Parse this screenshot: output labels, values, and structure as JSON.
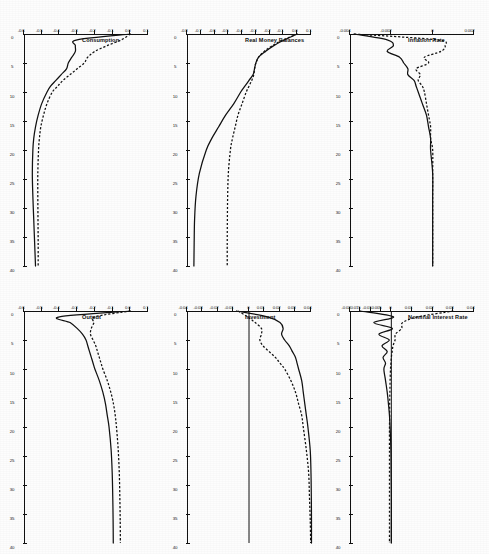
{
  "figure": {
    "orientation": "rotated-90",
    "rows": 2,
    "cols": 3,
    "line_color": "#111111",
    "background": "#ffffff"
  },
  "legend": {
    "series_solid": "Solid line",
    "series_dashed": "Dashed line"
  },
  "chart_data": [
    {
      "type": "line",
      "title": "Consumption",
      "xlabel": "",
      "ylabel": "",
      "xlim": [
        0,
        40
      ],
      "ylim": [
        -0.6,
        0.1
      ],
      "xticks": [
        0,
        5,
        10,
        15,
        20,
        25,
        30,
        35,
        40
      ],
      "xticklabels": [
        "0",
        "5",
        "10",
        "15",
        "20",
        "25",
        "30",
        "35",
        "40"
      ],
      "yticks": [
        0.1,
        0.0,
        -0.1,
        -0.2,
        -0.3,
        -0.4,
        -0.5,
        -0.6
      ],
      "yticklabels": [
        "0.1",
        "0.0",
        "-0.1",
        "-0.2",
        "-0.3",
        "-0.4",
        "-0.5",
        "-0.6"
      ],
      "grid": false,
      "x": [
        0,
        1,
        2,
        3,
        4,
        5,
        6,
        7,
        8,
        9,
        10,
        12,
        14,
        16,
        18,
        20,
        24,
        28,
        32,
        36,
        40
      ],
      "series": [
        {
          "name": "Solid line",
          "values": [
            0.0,
            -0.3,
            -0.31,
            -0.31,
            -0.33,
            -0.35,
            -0.36,
            -0.39,
            -0.42,
            -0.45,
            -0.47,
            -0.5,
            -0.52,
            -0.535,
            -0.545,
            -0.55,
            -0.553,
            -0.55,
            -0.545,
            -0.54,
            -0.535
          ]
        },
        {
          "name": "Dashed line",
          "values": [
            0.0,
            -0.05,
            -0.13,
            -0.2,
            -0.24,
            -0.26,
            -0.3,
            -0.34,
            -0.38,
            -0.41,
            -0.44,
            -0.47,
            -0.49,
            -0.505,
            -0.513,
            -0.518,
            -0.522,
            -0.522,
            -0.521,
            -0.52,
            -0.52
          ]
        }
      ]
    },
    {
      "type": "line",
      "title": "Real Money Balances",
      "xlabel": "",
      "ylabel": "",
      "xlim": [
        0,
        40
      ],
      "ylim": [
        -0.8,
        0.1
      ],
      "xticks": [
        0,
        5,
        10,
        15,
        20,
        25,
        30,
        35,
        40
      ],
      "xticklabels": [
        "0",
        "5",
        "10",
        "15",
        "20",
        "25",
        "30",
        "35",
        "40"
      ],
      "yticks": [
        0.1,
        0.0,
        -0.1,
        -0.2,
        -0.3,
        -0.4,
        -0.5,
        -0.6,
        -0.7,
        -0.8
      ],
      "yticklabels": [
        "0.1",
        "0.0",
        "-0.1",
        "-0.2",
        "-0.3",
        "-0.4",
        "-0.5",
        "-0.6",
        "-0.7",
        "-0.8"
      ],
      "grid": false,
      "x": [
        0,
        1,
        2,
        3,
        4,
        5,
        6,
        7,
        8,
        9,
        10,
        12,
        14,
        16,
        18,
        20,
        24,
        28,
        32,
        36,
        40
      ],
      "series": [
        {
          "name": "Solid line",
          "values": [
            0.0,
            -0.09,
            -0.17,
            -0.23,
            -0.28,
            -0.3,
            -0.31,
            -0.32,
            -0.35,
            -0.38,
            -0.41,
            -0.46,
            -0.52,
            -0.57,
            -0.62,
            -0.66,
            -0.71,
            -0.735,
            -0.745,
            -0.748,
            -0.75
          ]
        },
        {
          "name": "Dashed line",
          "values": [
            0.0,
            -0.1,
            -0.18,
            -0.24,
            -0.28,
            -0.3,
            -0.31,
            -0.315,
            -0.33,
            -0.35,
            -0.37,
            -0.4,
            -0.43,
            -0.45,
            -0.47,
            -0.485,
            -0.5,
            -0.505,
            -0.507,
            -0.508,
            -0.508
          ]
        }
      ]
    },
    {
      "type": "line",
      "title": "Inflation Rate",
      "xlabel": "",
      "ylabel": "",
      "xlim": [
        0,
        40
      ],
      "ylim": [
        -0.004,
        0.002
      ],
      "xticks": [
        0,
        5,
        10,
        15,
        20,
        25,
        30,
        35,
        40
      ],
      "xticklabels": [
        "0",
        "5",
        "10",
        "15",
        "20",
        "25",
        "30",
        "35",
        "40"
      ],
      "yticks": [
        0.002,
        0.0,
        -0.002,
        -0.004
      ],
      "yticklabels": [
        "0.002",
        "0",
        "-0.002",
        "-0.004"
      ],
      "grid": false,
      "x": [
        0,
        1,
        2,
        3,
        4,
        5,
        6,
        7,
        8,
        9,
        10,
        12,
        14,
        16,
        18,
        20,
        24,
        28,
        32,
        36,
        40
      ],
      "series": [
        {
          "name": "Solid line",
          "values": [
            -0.0038,
            -0.0022,
            -0.0019,
            -0.0022,
            -0.0016,
            -0.0014,
            -0.0012,
            -0.0012,
            -0.0009,
            -0.0008,
            -0.0007,
            -0.0005,
            -0.0003,
            -0.0002,
            -0.0001,
            -0.0001,
            0.0,
            0.0,
            0.0,
            0.0,
            0.0
          ]
        },
        {
          "name": "Dashed line",
          "values": [
            -0.0038,
            0.0002,
            0.0006,
            0.0004,
            -0.0004,
            -0.0002,
            -0.0008,
            -0.0006,
            -0.0007,
            -0.0005,
            -0.0004,
            -0.0003,
            -0.0002,
            -0.0001,
            -0.0001,
            0.0,
            0.0,
            0.0,
            0.0,
            0.0,
            0.0
          ]
        }
      ]
    },
    {
      "type": "line",
      "title": "Output",
      "xlabel": "",
      "ylabel": "",
      "xlim": [
        0,
        40
      ],
      "ylim": [
        -0.6,
        0.1
      ],
      "xticks": [
        0,
        5,
        10,
        15,
        20,
        25,
        30,
        35,
        40
      ],
      "xticklabels": [
        "0",
        "5",
        "10",
        "15",
        "20",
        "25",
        "30",
        "35",
        "40"
      ],
      "yticks": [
        0.1,
        0.0,
        -0.1,
        -0.2,
        -0.3,
        -0.4,
        -0.5,
        -0.6
      ],
      "yticklabels": [
        "0.1",
        "0.0",
        "-0.1",
        "-0.2",
        "-0.3",
        "-0.4",
        "-0.5",
        "-0.6"
      ],
      "grid": false,
      "x": [
        0,
        1,
        2,
        3,
        4,
        5,
        6,
        7,
        8,
        9,
        10,
        12,
        14,
        16,
        18,
        20,
        24,
        28,
        32,
        36,
        40
      ],
      "series": [
        {
          "name": "Solid line",
          "values": [
            0.0,
            -0.4,
            -0.34,
            -0.3,
            -0.27,
            -0.25,
            -0.24,
            -0.23,
            -0.22,
            -0.21,
            -0.2,
            -0.175,
            -0.155,
            -0.14,
            -0.13,
            -0.12,
            -0.108,
            -0.102,
            -0.099,
            -0.097,
            -0.096
          ]
        },
        {
          "name": "Dashed line",
          "values": [
            0.0,
            -0.2,
            -0.205,
            -0.22,
            -0.225,
            -0.21,
            -0.195,
            -0.185,
            -0.175,
            -0.165,
            -0.155,
            -0.13,
            -0.11,
            -0.095,
            -0.085,
            -0.078,
            -0.068,
            -0.062,
            -0.059,
            -0.057,
            -0.056
          ]
        }
      ]
    },
    {
      "type": "line",
      "title": "Investment",
      "xlabel": "",
      "ylabel": "",
      "xlim": [
        0,
        40
      ],
      "ylim": [
        -0.04,
        0.04
      ],
      "xticks": [
        0,
        5,
        10,
        15,
        20,
        25,
        30,
        35,
        40
      ],
      "xticklabels": [
        "0",
        "5",
        "10",
        "15",
        "20",
        "25",
        "30",
        "35",
        "40"
      ],
      "yticks": [
        0.04,
        0.03,
        0.02,
        0.01,
        0.0,
        -0.01,
        -0.02,
        -0.03,
        -0.04
      ],
      "yticklabels": [
        "0.04",
        "0.03",
        "0.02",
        "0.01",
        "0",
        "-0.01",
        "-0.02",
        "-0.03",
        "-0.04"
      ],
      "grid": false,
      "zero_reference_line": true,
      "x": [
        0,
        1,
        2,
        3,
        4,
        5,
        6,
        7,
        8,
        9,
        10,
        12,
        14,
        16,
        18,
        20,
        24,
        28,
        32,
        36,
        40
      ],
      "series": [
        {
          "name": "Solid line",
          "values": [
            -0.008,
            0.012,
            0.02,
            0.022,
            0.021,
            0.023,
            0.026,
            0.028,
            0.03,
            0.031,
            0.032,
            0.034,
            0.035,
            0.036,
            0.037,
            0.038,
            0.0395,
            0.04,
            0.0402,
            0.0403,
            0.0403
          ]
        },
        {
          "name": "Dashed line",
          "values": [
            -0.007,
            -0.001,
            0.004,
            0.008,
            0.008,
            0.007,
            0.009,
            0.013,
            0.017,
            0.02,
            0.023,
            0.027,
            0.03,
            0.032,
            0.034,
            0.035,
            0.037,
            0.0385,
            0.039,
            0.0395,
            0.0398
          ]
        }
      ]
    },
    {
      "type": "line",
      "title": "Nominal Interest Rate",
      "xlabel": "",
      "ylabel": "",
      "xlim": [
        0,
        40
      ],
      "ylim": [
        -0.02,
        0.04
      ],
      "xticks": [
        0,
        5,
        10,
        15,
        20,
        25,
        30,
        35,
        40
      ],
      "xticklabels": [
        "0",
        "5",
        "10",
        "15",
        "20",
        "25",
        "30",
        "35",
        "40"
      ],
      "yticks": [
        0.04,
        0.03,
        0.02,
        0.01,
        0.0,
        -0.005,
        -0.01,
        -0.015,
        -0.02
      ],
      "yticklabels": [
        "0.04",
        "0.03",
        "0.02",
        "0.01",
        "0",
        "-0.005",
        "-0.01",
        "-0.015",
        "-0.02"
      ],
      "grid": false,
      "zero_reference_line": true,
      "x": [
        0,
        1,
        2,
        3,
        4,
        5,
        6,
        7,
        8,
        9,
        10,
        12,
        14,
        16,
        18,
        20,
        24,
        28,
        32,
        36,
        40
      ],
      "series": [
        {
          "name": "Solid line",
          "values": [
            -0.015,
            0.001,
            -0.0085,
            0.0005,
            -0.006,
            -0.001,
            -0.0045,
            -0.002,
            -0.004,
            -0.0028,
            -0.0036,
            -0.0028,
            -0.002,
            -0.0014,
            -0.0009,
            -0.0006,
            -0.0002,
            -0.0001,
            0.0,
            0.0,
            0.0
          ]
        },
        {
          "name": "Dashed line",
          "values": [
            0.03,
            0.013,
            0.0055,
            0.005,
            0.002,
            0.0018,
            0.0008,
            0.0004,
            0.0,
            -0.0002,
            -0.0004,
            -0.0006,
            -0.0007,
            -0.0008,
            -0.0008,
            -0.0009,
            -0.0009,
            -0.0009,
            -0.0009,
            -0.0009,
            -0.0009
          ]
        }
      ]
    }
  ]
}
